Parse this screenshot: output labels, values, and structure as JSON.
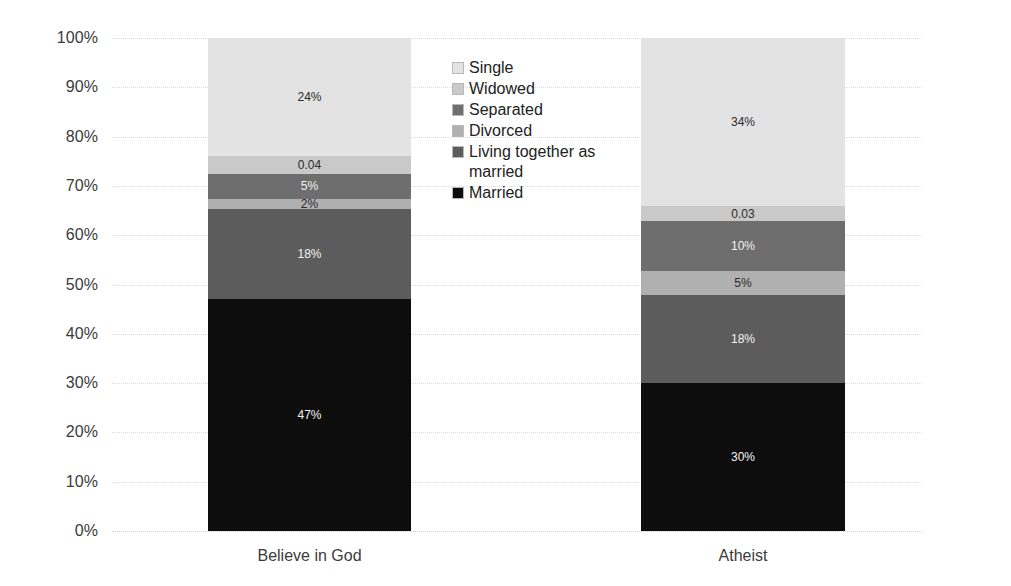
{
  "chart_data": {
    "type": "bar",
    "subtype": "100% stacked bar",
    "title": "",
    "xlabel": "",
    "ylabel": "",
    "categories": [
      "Believe in God",
      "Atheist"
    ],
    "ylim": [
      0,
      100
    ],
    "y_ticks": [
      "0%",
      "10%",
      "20%",
      "30%",
      "40%",
      "50%",
      "60%",
      "70%",
      "80%",
      "90%",
      "100%"
    ],
    "y_tick_values": [
      0,
      10,
      20,
      30,
      40,
      50,
      60,
      70,
      80,
      90,
      100
    ],
    "grid": true,
    "legend_position": "center",
    "stack_order_bottom_to_top": [
      "Married",
      "Living together as married",
      "Divorced",
      "Separated",
      "Widowed",
      "Single"
    ],
    "series": [
      {
        "name": "Single",
        "color": "#e3e3e3",
        "values": [
          24,
          34
        ],
        "labels": [
          "24%",
          "34%"
        ]
      },
      {
        "name": "Widowed",
        "color": "#c9c9c9",
        "values": [
          3.6,
          3.2
        ],
        "labels": [
          "0.04",
          "0.03"
        ]
      },
      {
        "name": "Separated",
        "color": "#6e6e6e",
        "values": [
          5,
          10
        ],
        "labels": [
          "5%",
          "10%"
        ]
      },
      {
        "name": "Divorced",
        "color": "#b0b0b0",
        "values": [
          2,
          5
        ],
        "labels": [
          "2%",
          "5%"
        ]
      },
      {
        "name": "Living together as married",
        "color": "#5c5c5c",
        "values": [
          18.4,
          17.8
        ],
        "labels": [
          "18%",
          "18%"
        ]
      },
      {
        "name": "Married",
        "color": "#0d0d0d",
        "values": [
          47,
          30
        ],
        "labels": [
          "47%",
          "30%"
        ]
      }
    ]
  },
  "legend": {
    "items": [
      {
        "label": "Single",
        "color": "#e3e3e3"
      },
      {
        "label": "Widowed",
        "color": "#c9c9c9"
      },
      {
        "label": "Separated",
        "color": "#6e6e6e"
      },
      {
        "label": "Divorced",
        "color": "#b0b0b0"
      },
      {
        "label": "Living together as married",
        "color": "#5c5c5c"
      },
      {
        "label": "Married",
        "color": "#0d0d0d"
      }
    ]
  },
  "axis": {
    "y_ticks": [
      "100%",
      "90%",
      "80%",
      "70%",
      "60%",
      "50%",
      "40%",
      "30%",
      "20%",
      "10%",
      "0%"
    ],
    "x_categories": [
      "Believe in God",
      "Atheist"
    ]
  },
  "colors": {
    "background": "#ffffff",
    "gridline": "#dedede",
    "tick_text": "#3b3b3b",
    "legend_text": "#222222",
    "label_dark": "#2b2b2b",
    "label_light": "#f2f2f2"
  }
}
